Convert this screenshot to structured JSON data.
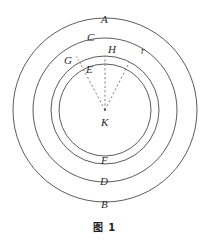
{
  "figure": {
    "caption": "图 1",
    "type": "concentric-circles-geometry-diagram",
    "center_label": "K",
    "stroke_color": "#4a4a4a",
    "dash_color": "#7a6f6f",
    "text_color": "#2b2b2b",
    "background_color": "#ffffff",
    "circles": [
      {
        "name": "outer-circle-B",
        "label": "B",
        "cx": 105,
        "cy": 110,
        "r": 92
      },
      {
        "name": "circle-D",
        "label": "D",
        "cx": 105,
        "cy": 110,
        "r": 72
      },
      {
        "name": "circle-C-F",
        "label_top": "C",
        "label_bottom": "F",
        "cx": 105,
        "cy": 110,
        "r": 54
      },
      {
        "name": "inner-circle-E",
        "label": "E",
        "cx": 105,
        "cy": 110,
        "r": 46
      }
    ],
    "radii_lines": [
      {
        "name": "radius-to-G",
        "from": "K",
        "to": "G",
        "angle_deg": 118
      },
      {
        "name": "radius-to-H",
        "from": "K",
        "to": "H",
        "angle_deg": 90
      },
      {
        "name": "radius-r",
        "from": "K",
        "to": "r",
        "angle_deg": 63
      }
    ],
    "labels": [
      {
        "id": "label-A",
        "text": "A",
        "x": 101,
        "y": 14
      },
      {
        "id": "label-C",
        "text": "C",
        "x": 87,
        "y": 32
      },
      {
        "id": "label-H",
        "text": "H",
        "x": 108,
        "y": 44
      },
      {
        "id": "label-r",
        "text": "r",
        "x": 141,
        "y": 46
      },
      {
        "id": "label-G",
        "text": "G",
        "x": 64,
        "y": 55
      },
      {
        "id": "label-E",
        "text": "E",
        "x": 86,
        "y": 64
      },
      {
        "id": "label-K",
        "text": "K",
        "x": 101,
        "y": 117
      },
      {
        "id": "label-F",
        "text": "F",
        "x": 101,
        "y": 155
      },
      {
        "id": "label-D",
        "text": "D",
        "x": 100,
        "y": 176
      },
      {
        "id": "label-B",
        "text": "B",
        "x": 101,
        "y": 199
      }
    ]
  }
}
